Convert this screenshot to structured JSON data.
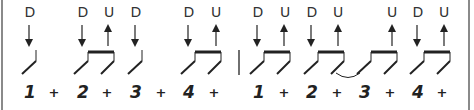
{
  "diagram": {
    "colors": {
      "ink": "#222222",
      "border": "#8a8a8a",
      "background": "#ffffff"
    },
    "measures": [
      {
        "slots": [
          {
            "count": "1",
            "x": 30,
            "stroke": "D",
            "arrow": "down-arrow"
          },
          {
            "count": "+",
            "x": 54,
            "stroke": "",
            "arrow": ""
          },
          {
            "count": "2",
            "x": 83,
            "stroke": "D",
            "arrow": "down-arrow"
          },
          {
            "count": "+",
            "x": 107,
            "stroke": "U",
            "arrow": "up-arrow"
          },
          {
            "count": "3",
            "x": 136,
            "stroke": "D",
            "arrow": "down-arrow"
          },
          {
            "count": "+",
            "x": 161,
            "stroke": "",
            "arrow": ""
          },
          {
            "count": "4",
            "x": 189,
            "stroke": "D",
            "arrow": "down-arrow"
          },
          {
            "count": "+",
            "x": 214,
            "stroke": "U",
            "arrow": "up-arrow"
          }
        ]
      },
      {
        "slots": [
          {
            "count": "1",
            "x": 259,
            "stroke": "D",
            "arrow": "down-arrow"
          },
          {
            "count": "+",
            "x": 284,
            "stroke": "U",
            "arrow": "up-arrow"
          },
          {
            "count": "2",
            "x": 312,
            "stroke": "D",
            "arrow": "down-arrow"
          },
          {
            "count": "+",
            "x": 337,
            "stroke": "U",
            "arrow": "up-arrow"
          },
          {
            "count": "3",
            "x": 365,
            "stroke": "",
            "arrow": ""
          },
          {
            "count": "+",
            "x": 390,
            "stroke": "U",
            "arrow": "up-arrow"
          },
          {
            "count": "4",
            "x": 418,
            "stroke": "D",
            "arrow": "down-arrow"
          },
          {
            "count": "+",
            "x": 442,
            "stroke": "U",
            "arrow": "up-arrow"
          }
        ]
      }
    ],
    "ties": [
      {
        "from_x": 337,
        "to_x": 362
      }
    ]
  }
}
